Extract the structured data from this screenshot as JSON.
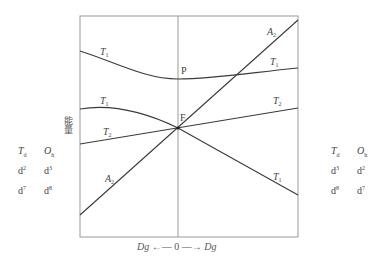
{
  "diagram": {
    "type": "orgel-diagram",
    "y_axis_label": "能量",
    "x_axis": {
      "left_label": "Dg",
      "center_label": "0",
      "right_label": "Dg",
      "arrow_left": "←—",
      "arrow_right": "—→"
    },
    "points": {
      "P": "P",
      "F": "F"
    },
    "curves": [
      {
        "name": "upper-T1-left",
        "label": "T",
        "sub": "1"
      },
      {
        "name": "lower-T1-left",
        "label": "T",
        "sub": "1"
      },
      {
        "name": "T2-left",
        "label": "T",
        "sub": "2"
      },
      {
        "name": "A2-left",
        "label": "A",
        "sub": "2"
      },
      {
        "name": "A2-right",
        "label": "A",
        "sub": "2"
      },
      {
        "name": "upper-T1-right",
        "label": "T",
        "sub": "1"
      },
      {
        "name": "T2-right",
        "label": "T",
        "sub": "2"
      },
      {
        "name": "lower-T1-right",
        "label": "T",
        "sub": "1"
      }
    ],
    "left_table": {
      "headers": [
        {
          "main": "T",
          "sub": "d"
        },
        {
          "main": "O",
          "sub": "h"
        }
      ],
      "rows": [
        [
          {
            "base": "d",
            "sup": "2"
          },
          {
            "base": "d",
            "sup": "3"
          }
        ],
        [
          {
            "base": "d",
            "sup": "7"
          },
          {
            "base": "d",
            "sup": "8"
          }
        ]
      ]
    },
    "right_table": {
      "headers": [
        {
          "main": "T",
          "sub": "d"
        },
        {
          "main": "O",
          "sub": "h"
        }
      ],
      "rows": [
        [
          {
            "base": "d",
            "sup": "3"
          },
          {
            "base": "d",
            "sup": "2"
          }
        ],
        [
          {
            "base": "d",
            "sup": "8"
          },
          {
            "base": "d",
            "sup": "7"
          }
        ]
      ]
    },
    "colors": {
      "frame": "#9a9a9a",
      "lines": "#3a3a3a",
      "text": "#444444"
    }
  }
}
